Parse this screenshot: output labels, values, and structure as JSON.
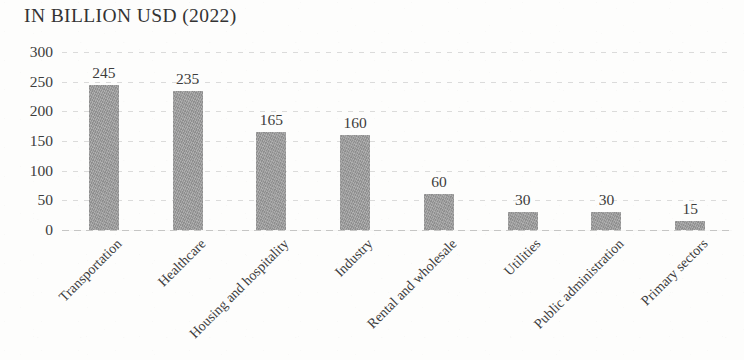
{
  "chart_data": {
    "type": "bar",
    "title": "IN BILLION USD (2022)",
    "xlabel": "",
    "ylabel": "",
    "ylim": [
      0,
      300
    ],
    "yticks": [
      0,
      50,
      100,
      150,
      200,
      250,
      300
    ],
    "grid": true,
    "legend": null,
    "bar_color": "#9b9b9b",
    "categories": [
      "Transportation",
      "Healthcare",
      "Housing and hospitality",
      "Industry",
      "Rental and wholesale",
      "Utilities",
      "Public administration",
      "Primary sectors"
    ],
    "values": [
      245,
      235,
      165,
      160,
      60,
      30,
      30,
      15
    ],
    "data_labels": [
      "245",
      "235",
      "165",
      "160",
      "60",
      "30",
      "30",
      "15"
    ],
    "ytick_labels": [
      "300",
      "250",
      "200",
      "150",
      "100",
      "50",
      "0"
    ]
  }
}
